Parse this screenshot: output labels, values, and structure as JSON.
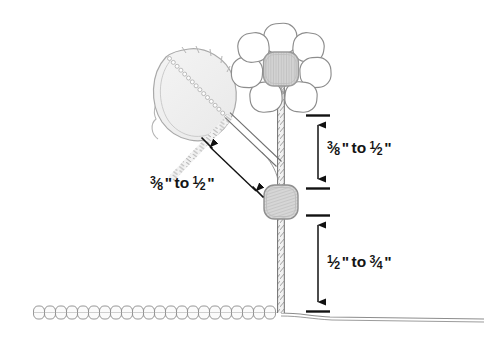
{
  "diagram": {
    "background_color": "#ffffff",
    "line_color": "#4a4a4a",
    "fill_gray": "#d0d0d0",
    "text_color": "#141414",
    "dimensions": [
      {
        "id": "upper-right",
        "orientation": "vertical",
        "text": "3/8\" to 1/2\"",
        "numerator_1": "3",
        "slash_1": "⁄",
        "denominator_1": "8",
        "quote_1": "\"",
        "connector": "to",
        "numerator_2": "1",
        "slash_2": "⁄",
        "denominator_2": "2",
        "quote_2": "\"",
        "measures": "distance from flower head to middle bead"
      },
      {
        "id": "lower-right",
        "orientation": "vertical",
        "text": "1/2\" to 3/4\"",
        "numerator_1": "1",
        "slash_1": "⁄",
        "denominator_1": "2",
        "quote_1": "\"",
        "connector": "to",
        "numerator_2": "3",
        "slash_2": "⁄",
        "denominator_2": "4",
        "quote_2": "\"",
        "measures": "distance from middle bead to ground row"
      },
      {
        "id": "left-diagonal",
        "orientation": "diagonal",
        "text": "3/8\" to 1/2\"",
        "numerator_1": "3",
        "slash_1": "⁄",
        "denominator_1": "8",
        "quote_1": "\"",
        "connector": "to",
        "numerator_2": "1",
        "slash_2": "⁄",
        "denominator_2": "2",
        "quote_2": "\"",
        "measures": "distance from leaf branch to middle bead"
      }
    ],
    "parts": {
      "flower_head": "flower-head",
      "petal_count": 8,
      "flower_center": "flower-center-bead",
      "leaf": "leaf",
      "leaf_stalk": "leaf-stalk",
      "middle_bead": "middle-bead",
      "main_stem": "main-stem",
      "ground_bead_row": "ground-bead-row",
      "ground_thread": "ground-thread"
    }
  }
}
